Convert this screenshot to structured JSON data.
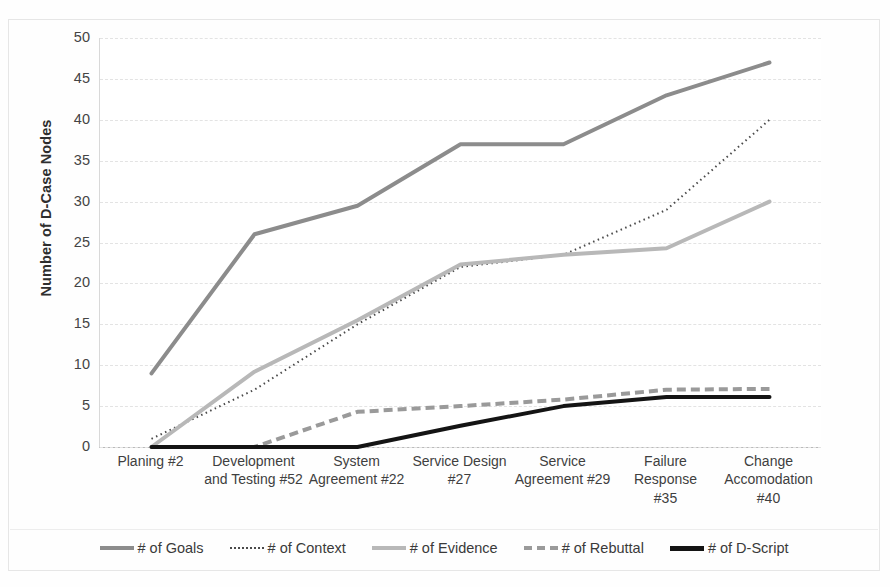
{
  "chart_data": {
    "type": "line",
    "title": "",
    "xlabel": "",
    "ylabel": "Number of D-Case Nodes",
    "ylim": [
      0,
      50
    ],
    "yticks": [
      0,
      5,
      10,
      15,
      20,
      25,
      30,
      35,
      40,
      45,
      50
    ],
    "grid": true,
    "legend_position": "bottom",
    "categories": [
      "Planing #2",
      "Development and Testing #52",
      "System Agreement #22",
      "Service Design #27",
      "Service Agreement #29",
      "Failure Response #35",
      "Change Accomodation #40"
    ],
    "category_label_lines": [
      [
        "Planing #2"
      ],
      [
        "Development",
        "and Testing #52"
      ],
      [
        "System",
        "Agreement #22"
      ],
      [
        "Service Design",
        "#27"
      ],
      [
        "Service",
        "Agreement #29"
      ],
      [
        "Failure Response",
        "#35"
      ],
      [
        "Change",
        "Accomodation",
        "#40"
      ]
    ],
    "series": [
      {
        "name": "# of Goals",
        "values": [
          9,
          26,
          29.5,
          37,
          37,
          43,
          47
        ],
        "color": "#8c8c8c",
        "style": "solid",
        "width": 4
      },
      {
        "name": "# of Context",
        "values": [
          1,
          7,
          15,
          22,
          23.5,
          29,
          40
        ],
        "color": "#4a4a4a",
        "style": "dotted",
        "width": 2
      },
      {
        "name": "# of Evidence",
        "values": [
          0,
          9.2,
          15.5,
          22.3,
          23.5,
          24.3,
          30
        ],
        "color": "#b8b8b8",
        "style": "solid",
        "width": 4
      },
      {
        "name": "# of Rebuttal",
        "values": [
          0,
          0,
          4.3,
          5,
          5.8,
          7,
          7.1
        ],
        "color": "#9a9a9a",
        "style": "dashed",
        "width": 4
      },
      {
        "name": "# of D-Script",
        "values": [
          0,
          0,
          0,
          2.6,
          5,
          6.1,
          6.1
        ],
        "color": "#141414",
        "style": "solid",
        "width": 4
      }
    ]
  },
  "legend": {
    "items": [
      {
        "label": "# of Goals",
        "swatch": "sw-goals"
      },
      {
        "label": "# of Context",
        "swatch": "sw-context"
      },
      {
        "label": "# of Evidence",
        "swatch": "sw-evidence"
      },
      {
        "label": "# of Rebuttal",
        "swatch": "sw-rebuttal"
      },
      {
        "label": "# of D-Script",
        "swatch": "sw-dscript"
      }
    ]
  },
  "colors": {
    "goals": "#8c8c8c",
    "context": "#4a4a4a",
    "evidence": "#b8b8b8",
    "rebuttal": "#9a9a9a",
    "dscript": "#141414",
    "gridline": "#e3e3e3",
    "axis": "#b9b9b9",
    "text": "#3a3a3a",
    "background": "#ffffff"
  }
}
